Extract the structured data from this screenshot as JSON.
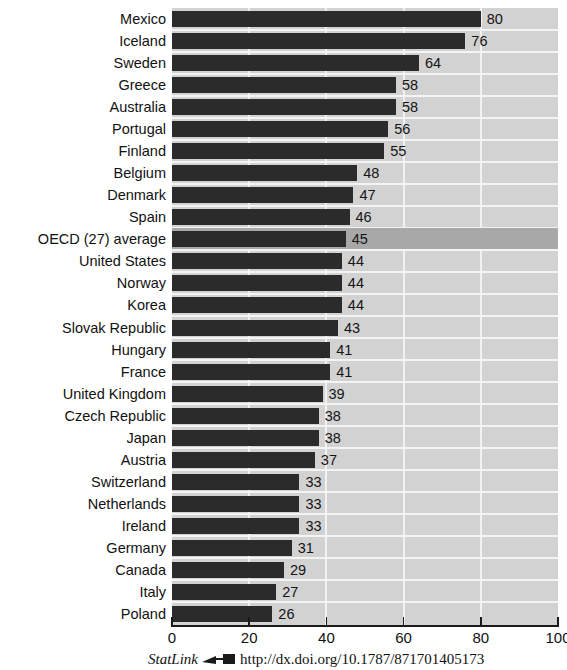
{
  "chart_data": {
    "type": "bar",
    "orientation": "horizontal",
    "title": "",
    "xlabel": "",
    "ylabel": "",
    "xlim": [
      0,
      100
    ],
    "xticks": [
      0,
      20,
      40,
      60,
      80,
      100
    ],
    "grid": true,
    "grid_orientation": "vertical",
    "legend": "none",
    "categories": [
      "Mexico",
      "Iceland",
      "Sweden",
      "Greece",
      "Australia",
      "Portugal",
      "Finland",
      "Belgium",
      "Denmark",
      "Spain",
      "OECD (27) average",
      "United States",
      "Norway",
      "Korea",
      "Slovak Republic",
      "Hungary",
      "France",
      "United Kingdom",
      "Czech Republic",
      "Japan",
      "Austria",
      "Switzerland",
      "Netherlands",
      "Ireland",
      "Germany",
      "Canada",
      "Italy",
      "Poland"
    ],
    "values": [
      80,
      76,
      64,
      58,
      58,
      56,
      55,
      48,
      47,
      46,
      45,
      44,
      44,
      44,
      43,
      41,
      41,
      39,
      38,
      38,
      37,
      33,
      33,
      33,
      31,
      29,
      27,
      26
    ],
    "highlighted_category": "OECD (27) average",
    "bar_color": "#2b2b2b",
    "plot_background": "#d2d2d2",
    "highlight_band_color": "#a8a8a8",
    "gridline_color": "#f2f2f2"
  },
  "axis": {
    "tick_labels": [
      "0",
      "20",
      "40",
      "60",
      "80",
      "100"
    ]
  },
  "footer": {
    "statlink_label": "StatLink",
    "icon": "statlink-arrow-icon",
    "url": "http://dx.doi.org/10.1787/871701405173"
  }
}
